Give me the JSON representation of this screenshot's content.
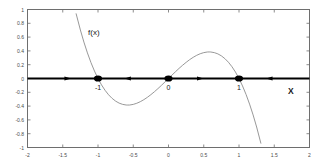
{
  "chart_data": {
    "type": "line",
    "title": "",
    "xlabel": "X",
    "ylabel": "",
    "xlim": [
      -2,
      2
    ],
    "ylim": [
      -1,
      1
    ],
    "grid": false,
    "legend_position": "none",
    "function_label": "f(x)",
    "function_expression": "x - x^3",
    "xticks": [
      -2,
      -1.5,
      -1,
      -0.5,
      0,
      0.5,
      1,
      1.5,
      2
    ],
    "xtick_labels": [
      "-2",
      "-1.5",
      "-1",
      "-0.5",
      "0",
      "0.5",
      "1",
      "1.5",
      "2"
    ],
    "yticks": [
      -1,
      -0.8,
      -0.6,
      -0.4,
      -0.2,
      0,
      0.2,
      0.4,
      0.6,
      0.8,
      1
    ],
    "ytick_labels": [
      "-1",
      "-0.8",
      "-0.6",
      "-0.4",
      "-0.2",
      "0",
      "0.2",
      "0.4",
      "0.6",
      "0.8",
      "1"
    ],
    "series": [
      {
        "name": "f(x)",
        "color": "#8c8c8c",
        "x": [
          -1.31,
          -1.25,
          -1.2,
          -1.15,
          -1.1,
          -1.05,
          -1.0,
          -0.95,
          -0.9,
          -0.85,
          -0.8,
          -0.75,
          -0.7,
          -0.65,
          -0.6,
          -0.577,
          -0.55,
          -0.5,
          -0.45,
          -0.4,
          -0.35,
          -0.3,
          -0.25,
          -0.2,
          -0.15,
          -0.1,
          -0.05,
          0.0,
          0.05,
          0.1,
          0.15,
          0.2,
          0.25,
          0.3,
          0.35,
          0.4,
          0.45,
          0.5,
          0.55,
          0.577,
          0.6,
          0.65,
          0.7,
          0.75,
          0.8,
          0.85,
          0.9,
          0.95,
          1.0,
          1.05,
          1.1,
          1.15,
          1.2,
          1.25,
          1.31
        ],
        "y": [
          0.938,
          0.703,
          0.528,
          0.371,
          0.231,
          0.108,
          0.0,
          -0.093,
          -0.171,
          -0.236,
          -0.288,
          -0.328,
          -0.357,
          -0.375,
          -0.384,
          -0.385,
          -0.384,
          -0.375,
          -0.359,
          -0.336,
          -0.307,
          -0.273,
          -0.234,
          -0.192,
          -0.147,
          -0.099,
          -0.05,
          0.0,
          0.05,
          0.099,
          0.147,
          0.192,
          0.234,
          0.273,
          0.307,
          0.336,
          0.359,
          0.375,
          0.384,
          0.385,
          0.384,
          0.375,
          0.357,
          0.328,
          0.288,
          0.236,
          0.171,
          0.093,
          0.0,
          -0.108,
          -0.231,
          -0.371,
          -0.528,
          -0.703,
          -0.938
        ]
      }
    ],
    "phase_line": {
      "axis_y": 0,
      "equilibria": [
        {
          "x": -1,
          "label": "-1",
          "stability": "stable"
        },
        {
          "x": 0,
          "label": "0",
          "stability": "unstable"
        },
        {
          "x": 1,
          "label": "1",
          "stability": "stable"
        }
      ],
      "arrows": [
        {
          "x": -1.43,
          "direction": "right"
        },
        {
          "x": -0.58,
          "direction": "left"
        },
        {
          "x": 0.45,
          "direction": "right"
        },
        {
          "x": 1.43,
          "direction": "left"
        }
      ],
      "color": "#000000"
    }
  },
  "annotations": {
    "function_label": "f(x)",
    "axis_label": "X",
    "eq_left": "-1",
    "eq_mid": "0",
    "eq_right": "1"
  },
  "colors": {
    "curve": "#8c8c8c",
    "phase_line": "#000000",
    "frame": "#6e6e6e",
    "tick_text": "#4a4a4a",
    "annotation_text": "#1a1a1a",
    "background": "#ffffff"
  }
}
